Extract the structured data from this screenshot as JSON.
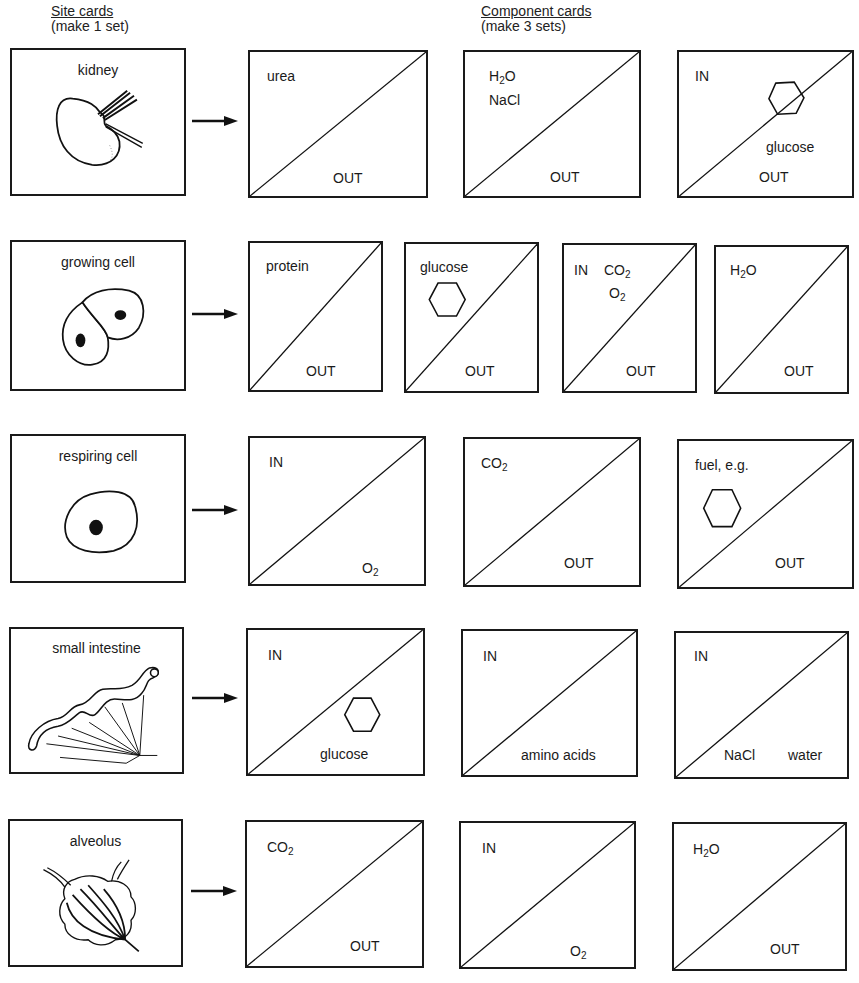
{
  "headings": {
    "site_title": "Site cards",
    "site_subtitle": "(make 1 set)",
    "component_title": "Component cards",
    "component_subtitle": "(make 3 sets)"
  },
  "rows": [
    {
      "site": {
        "label": "kidney",
        "illustration": "kidney-icon"
      },
      "components": [
        {
          "top_left": "urea",
          "bottom_right": "OUT"
        },
        {
          "top_left": "H2O",
          "top_left_2": "NaCl",
          "bottom_right": "OUT"
        },
        {
          "top_left": "IN",
          "mid": "glucose",
          "bottom_right": "OUT",
          "icon": "hexagon-icon"
        }
      ]
    },
    {
      "site": {
        "label": "growing cell",
        "illustration": "dividing-cell-icon"
      },
      "components": [
        {
          "top_left": "protein",
          "bottom_right": "OUT"
        },
        {
          "top_left": "glucose",
          "bottom_right": "OUT",
          "icon": "hexagon-icon"
        },
        {
          "top_left": "IN",
          "top_left_b": "CO2",
          "top_left_2": "O2",
          "bottom_right": "OUT"
        },
        {
          "top_left": "H2O",
          "bottom_right": "OUT"
        }
      ]
    },
    {
      "site": {
        "label": "respiring cell",
        "illustration": "cell-icon"
      },
      "components": [
        {
          "top_left": "IN",
          "bottom_right": "O2"
        },
        {
          "top_left": "CO2",
          "bottom_right": "OUT"
        },
        {
          "top_left": "fuel, e.g.",
          "bottom_right": "OUT",
          "icon": "hexagon-icon"
        }
      ]
    },
    {
      "site": {
        "label": "small intestine",
        "illustration": "intestine-icon"
      },
      "components": [
        {
          "top_left": "IN",
          "bottom_right": "glucose",
          "icon": "hexagon-icon"
        },
        {
          "top_left": "IN",
          "bottom_right": "amino acids"
        },
        {
          "top_left": "IN",
          "bottom_right": "water",
          "bottom_left": "NaCl"
        }
      ]
    },
    {
      "site": {
        "label": "alveolus",
        "illustration": "alveolus-icon"
      },
      "components": [
        {
          "top_left": "CO2",
          "bottom_right": "OUT"
        },
        {
          "top_left": "IN",
          "bottom_right": "O2"
        },
        {
          "top_left": "H2O",
          "bottom_right": "OUT"
        }
      ]
    }
  ]
}
